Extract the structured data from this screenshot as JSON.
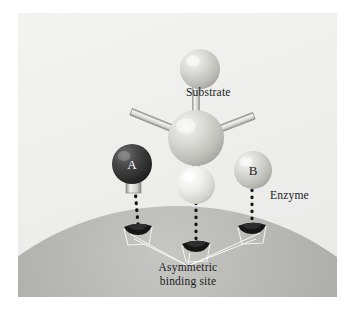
{
  "figure": {
    "background_color": "#ffffff",
    "panel_color": "#eeeeec"
  },
  "labels": {
    "substrate": "Substrate",
    "enzyme": "Enzyme",
    "binding_site_line1": "Asymmetric",
    "binding_site_line2": "binding site"
  },
  "atoms": [
    {
      "id": "top",
      "label": "",
      "label_color": "#1b1b1b",
      "fill": "#cfcfcb",
      "cx": 182,
      "cy": 56,
      "r": 20
    },
    {
      "id": "center",
      "label": "",
      "label_color": "#1b1b1b",
      "fill": "#d2d2ce",
      "cx": 178,
      "cy": 125,
      "r": 28
    },
    {
      "id": "bottom",
      "label": "",
      "label_color": "#1b1b1b",
      "fill": "#ebebe7",
      "cx": 178,
      "cy": 172,
      "r": 19
    },
    {
      "id": "A",
      "label": "A",
      "label_color": "#ffffff",
      "fill": "#3a3a3a",
      "cx": 114,
      "cy": 151,
      "r": 20
    },
    {
      "id": "B",
      "label": "B",
      "label_color": "#2a2a2a",
      "fill": "#d9d9d4",
      "cx": 235,
      "cy": 157,
      "r": 19
    }
  ],
  "binding_sites": [
    {
      "id": "site-A",
      "x": 120,
      "y": 213
    },
    {
      "id": "site-center",
      "x": 178,
      "y": 230
    },
    {
      "id": "site-B",
      "x": 234,
      "y": 212
    }
  ],
  "colors": {
    "substrate_sphere": "#d2d2ce",
    "group_a_sphere": "#3a3a3a",
    "group_b_sphere": "#d9d9d4",
    "enzyme_surface_light": "#b9b9b6",
    "enzyme_surface_dark": "#7e7e7c",
    "tether_line": "#1a1a1a",
    "leader_line": "#ffffff",
    "text": "#1b1b1b"
  }
}
